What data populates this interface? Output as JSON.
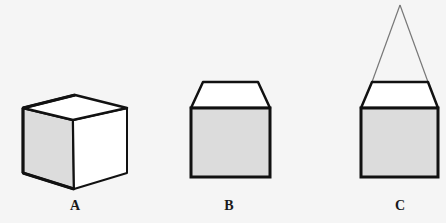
{
  "figures": [
    {
      "id": "A",
      "label": "A",
      "description": "cube drawn in perspective"
    },
    {
      "id": "B",
      "label": "B",
      "description": "square with trapezoid on top"
    },
    {
      "id": "C",
      "label": "C",
      "description": "square with trapezoid on top and converging lines to a vanishing point"
    }
  ],
  "colors": {
    "background": "#f5f5f5",
    "stroke": "#111111",
    "shaded_face": "#dcdcdc",
    "light_face": "#ffffff",
    "vanishing_lines": "#777777"
  }
}
